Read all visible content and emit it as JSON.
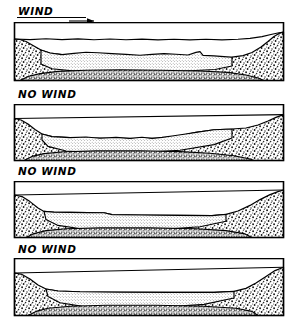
{
  "figure": {
    "background_color": "#ffffff",
    "ink_color": "#000000",
    "width": 295,
    "height": 323
  },
  "panels": [
    {
      "id": "panel-1",
      "label": "WIND",
      "has_wind_arrow": true,
      "arrow_direction": "right",
      "label_underlined": true,
      "label_x": 18,
      "label_y": 5,
      "frame": {
        "x": 14,
        "y": 22,
        "width": 270,
        "height": 58
      },
      "water_surface_y": 12,
      "bank_fill": "coarse-stipple",
      "sediment_fill": "fine-dot",
      "bed_fill": "dense-speckle",
      "description": "Wind-driven: suspended sediment layer is thin, wavy and irregular; water surface is ruffled; left bank steep, right bank broad."
    },
    {
      "id": "panel-2",
      "label": "NO WIND",
      "has_wind_arrow": false,
      "arrow_direction": "",
      "label_underlined": false,
      "label_x": 18,
      "label_y": 88,
      "frame": {
        "x": 14,
        "y": 104,
        "width": 270,
        "height": 56
      },
      "water_surface_y": 10,
      "bank_fill": "coarse-stipple",
      "sediment_fill": "fine-dot",
      "bed_fill": "dense-speckle",
      "description": "No wind: sediment surface flat on the left, rising as a ramp toward the right bank."
    },
    {
      "id": "panel-3",
      "label": "NO WIND",
      "has_wind_arrow": false,
      "arrow_direction": "",
      "label_underlined": false,
      "label_x": 18,
      "label_y": 166,
      "frame": {
        "x": 14,
        "y": 181,
        "width": 270,
        "height": 56
      },
      "water_surface_y": 10,
      "bank_fill": "coarse-stipple",
      "sediment_fill": "fine-dot",
      "bed_fill": "dense-speckle",
      "description": "No wind: nearly level sediment surface with a small step on the left; banks steep at both sides."
    },
    {
      "id": "panel-4",
      "label": "NO WIND",
      "has_wind_arrow": false,
      "arrow_direction": "",
      "label_underlined": false,
      "label_x": 18,
      "label_y": 243,
      "frame": {
        "x": 14,
        "y": 258,
        "width": 270,
        "height": 57
      },
      "water_surface_y": 10,
      "bank_fill": "coarse-stipple",
      "sediment_fill": "fine-dot",
      "bed_fill": "dense-speckle",
      "description": "No wind: smooth concave basin, flat sediment surface spanning the full width."
    }
  ],
  "legend_keys": {
    "bank": "coarse stippled sand bank",
    "suspension": "fine-dotted suspended sediment layer",
    "bed": "dense speckled bed"
  }
}
